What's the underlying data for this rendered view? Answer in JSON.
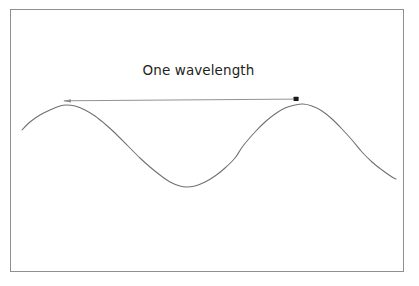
{
  "figure": {
    "title": "One wavelength",
    "background_color": "#ffffff",
    "frame_color": "#8d8f92",
    "wave_color": "#6e7073",
    "arrow_color": "#8a8c8f",
    "marker_color": "#1a1a1a",
    "label_color": "#231f20"
  },
  "annotation": {
    "label": "One wavelength",
    "arrow_name": "one-wavelength-arrow",
    "start_marker": "crest-one-marker",
    "end_marker": "crest-two-marker"
  },
  "chart_data": {
    "type": "line",
    "title": "One wavelength",
    "xlabel": "",
    "ylabel": "",
    "grid": false,
    "legend": null,
    "xlim": [
      22,
      396
    ],
    "ylim": [
      105,
      187
    ],
    "annotations": [
      {
        "text": "One wavelength",
        "type": "double-ended-measure-arrow",
        "from_x": 66,
        "to_x": 303,
        "at_y": 100,
        "length_px": 237,
        "describes": "horizontal distance between two successive wave crests"
      }
    ],
    "wave": {
      "midline_y": 146,
      "amplitude": 41,
      "wavelength_px": 237,
      "crest_x": [
        66,
        303
      ],
      "trough_x": [
        186
      ],
      "zero_crossings_x": [
        128,
        243,
        362
      ],
      "start_point": [
        22,
        130
      ],
      "end_point": [
        396,
        179
      ]
    },
    "series": [
      {
        "name": "wave",
        "x": [
          22,
          30,
          40,
          50,
          60,
          66,
          75,
          85,
          95,
          105,
          115,
          128,
          140,
          150,
          160,
          170,
          180,
          186,
          195,
          205,
          215,
          225,
          235,
          243,
          255,
          265,
          275,
          285,
          295,
          303,
          312,
          322,
          332,
          342,
          352,
          362,
          372,
          382,
          392,
          396
        ],
        "y": [
          130,
          122,
          115,
          110,
          106,
          105,
          106,
          110,
          116,
          124,
          133,
          146,
          158,
          167,
          175,
          182,
          186,
          187,
          186,
          182,
          176,
          168,
          158,
          146,
          132,
          122,
          114,
          108,
          105,
          104,
          106,
          111,
          119,
          129,
          140,
          152,
          162,
          170,
          177,
          179
        ]
      }
    ]
  }
}
